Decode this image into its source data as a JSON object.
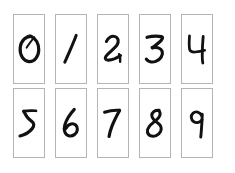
{
  "board": {
    "title": "Handwritten Digit Cards",
    "background_color": "#ffffff",
    "card_background_color": "#ffffff",
    "card_border_color": "#b4b4b4",
    "ink_color": "#111111",
    "rows": 2,
    "columns": 5,
    "card_count": 10
  },
  "cards": [
    {
      "digit": "0",
      "row": 1,
      "column": 1,
      "position": "top-row-1"
    },
    {
      "digit": "1",
      "row": 1,
      "column": 2,
      "position": "top-row-2"
    },
    {
      "digit": "2",
      "row": 1,
      "column": 3,
      "position": "top-row-3"
    },
    {
      "digit": "3",
      "row": 1,
      "column": 4,
      "position": "top-row-4"
    },
    {
      "digit": "4",
      "row": 1,
      "column": 5,
      "position": "top-row-5"
    },
    {
      "digit": "5",
      "row": 2,
      "column": 1,
      "position": "bottom-row-1"
    },
    {
      "digit": "6",
      "row": 2,
      "column": 2,
      "position": "bottom-row-2"
    },
    {
      "digit": "7",
      "row": 2,
      "column": 3,
      "position": "bottom-row-3"
    },
    {
      "digit": "8",
      "row": 2,
      "column": 4,
      "position": "bottom-row-4"
    },
    {
      "digit": "9",
      "row": 2,
      "column": 5,
      "position": "bottom-row-5"
    }
  ]
}
